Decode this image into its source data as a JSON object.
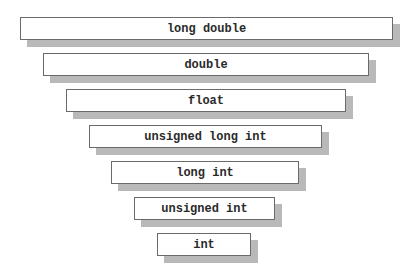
{
  "diagram": {
    "title": "",
    "boxes": [
      {
        "label": "long double"
      },
      {
        "label": "double"
      },
      {
        "label": "float"
      },
      {
        "label": "unsigned long int"
      },
      {
        "label": "long int"
      },
      {
        "label": "unsigned int"
      },
      {
        "label": "int"
      }
    ]
  }
}
